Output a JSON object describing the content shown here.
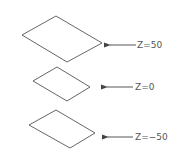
{
  "diagram": {
    "planes": [
      {
        "label": "Z=50",
        "points": [
          [
            56,
            16
          ],
          [
            102,
            43
          ],
          [
            67,
            62
          ],
          [
            22,
            35
          ]
        ],
        "arrow": {
          "x1": 136,
          "x2": 110,
          "y": 45
        },
        "text_x": 137,
        "text_y": 48
      },
      {
        "label": "Z=0",
        "points": [
          [
            57,
            67
          ],
          [
            90,
            87
          ],
          [
            67,
            101
          ],
          [
            33,
            81
          ]
        ],
        "arrow": {
          "x1": 133,
          "x2": 107,
          "y": 87
        },
        "text_x": 135,
        "text_y": 90
      },
      {
        "label": "Z=−50",
        "points": [
          [
            56,
            110
          ],
          [
            95,
            133
          ],
          [
            70,
            148
          ],
          [
            29,
            125
          ]
        ],
        "arrow": {
          "x1": 133,
          "x2": 108,
          "y": 137
        },
        "text_x": 135,
        "text_y": 140
      }
    ],
    "stroke_color": "#555555"
  }
}
